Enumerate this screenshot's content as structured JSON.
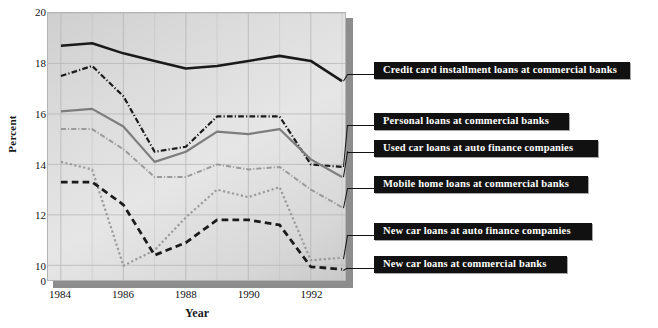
{
  "chart_data": {
    "type": "line",
    "title": "",
    "xlabel": "Year",
    "ylabel": "Percent",
    "x": [
      1984,
      1985,
      1986,
      1987,
      1988,
      1989,
      1990,
      1991,
      1992,
      1993
    ],
    "xticklabels": [
      "1984",
      "1986",
      "1988",
      "1990",
      "1992"
    ],
    "xtickvalues": [
      1984,
      1986,
      1988,
      1990,
      1992
    ],
    "xlim": [
      1984,
      1993
    ],
    "ylim": [
      0,
      20
    ],
    "yticklabels": [
      "0",
      "10",
      "12",
      "14",
      "16",
      "18",
      "20"
    ],
    "ytickvalues": [
      0,
      10,
      12,
      14,
      16,
      18,
      20
    ],
    "y_axis_broken": true,
    "grid": true,
    "legend_position": "right-callouts",
    "series": [
      {
        "name": "Credit card installment loans at commercial banks",
        "color": "#1a1a1a",
        "style": "solid",
        "width": 2.6,
        "values": [
          18.7,
          18.8,
          18.4,
          18.1,
          17.8,
          17.9,
          18.1,
          18.3,
          18.1,
          17.3
        ]
      },
      {
        "name": "Personal loans at commercial banks",
        "color": "#1a1a1a",
        "style": "dash-dot",
        "width": 2.2,
        "values": [
          17.5,
          17.9,
          16.7,
          14.5,
          14.7,
          15.9,
          15.9,
          15.9,
          14.0,
          13.9
        ]
      },
      {
        "name": "Used car loans at auto finance companies",
        "color": "#7d7d7d",
        "style": "solid",
        "width": 2.2,
        "values": [
          16.1,
          16.2,
          15.5,
          14.1,
          14.5,
          15.3,
          15.2,
          15.4,
          14.2,
          13.5
        ]
      },
      {
        "name": "Mobile home loans at commercial banks",
        "color": "#9a9a9a",
        "style": "dash-dot",
        "width": 2.0,
        "values": [
          15.4,
          15.4,
          14.6,
          13.5,
          13.5,
          14.0,
          13.8,
          13.9,
          13.0,
          12.3
        ]
      },
      {
        "name": "New car loans at auto finance companies",
        "color": "#9a9a9a",
        "style": "dotted",
        "width": 2.2,
        "values": [
          14.1,
          13.8,
          9.7,
          10.6,
          11.9,
          13.0,
          12.7,
          13.1,
          10.2,
          10.3
        ]
      },
      {
        "name": "New car loans at commercial banks",
        "color": "#1a1a1a",
        "style": "dashed",
        "width": 2.8,
        "values": [
          13.3,
          13.3,
          12.4,
          10.4,
          10.9,
          11.8,
          11.8,
          11.6,
          9.0,
          7.3
        ]
      }
    ]
  },
  "callouts": [
    {
      "label": "Credit card installment loans at commercial banks",
      "name": "callout-credit-card-installment-loans",
      "box": {
        "left": 374,
        "top": 68,
        "width": 238
      },
      "leader": {
        "left": 347,
        "top": 74,
        "width": 27
      },
      "anchor_series": 0
    },
    {
      "label": "Personal loans at commercial banks",
      "name": "callout-personal-loans",
      "box": {
        "left": 374,
        "top": 119,
        "width": 177
      },
      "leader": {
        "left": 347,
        "top": 125,
        "width": 27
      },
      "anchor_series": 1
    },
    {
      "label": "Used car loans at auto finance companies",
      "name": "callout-used-car-loans-auto-finance",
      "box": {
        "left": 374,
        "top": 146,
        "width": 206
      },
      "leader": {
        "left": 347,
        "top": 152,
        "width": 27
      },
      "anchor_series": 2
    },
    {
      "label": "Mobile home loans at commercial banks",
      "name": "callout-mobile-home-loans",
      "box": {
        "left": 374,
        "top": 182,
        "width": 196
      },
      "leader": {
        "left": 347,
        "top": 188,
        "width": 27
      },
      "anchor_series": 3
    },
    {
      "label": "New car loans at auto finance companies",
      "name": "callout-new-car-loans-auto-finance",
      "box": {
        "left": 374,
        "top": 229,
        "width": 200
      },
      "leader": {
        "left": 347,
        "top": 235,
        "width": 27
      },
      "anchor_series": 4
    },
    {
      "label": "New car loans at commercial banks",
      "name": "callout-new-car-loans-commercial-banks",
      "box": {
        "left": 374,
        "top": 262,
        "width": 175
      },
      "leader": {
        "left": 347,
        "top": 268,
        "width": 27
      },
      "anchor_series": 5
    }
  ],
  "colors": {
    "panel_light": "#e6e6e6",
    "panel_dark": "#c9c9c9",
    "grid": "#b8b8b8",
    "axis": "#8d8d8d",
    "callout_bg": "#111111",
    "callout_fg": "#ffffff",
    "text": "#111111"
  }
}
